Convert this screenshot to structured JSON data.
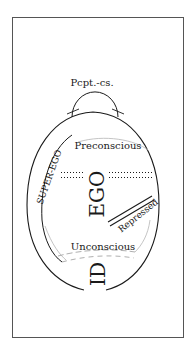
{
  "diagram": {
    "type": "structural model of the psyche",
    "labels": {
      "perception": "Pcpt.-cs.",
      "preconscious": "Preconscious",
      "ego": "EGO",
      "superego": "SUPER-EGO",
      "repressed": "Repressed",
      "unconscious": "Unconscious",
      "id": "ID"
    },
    "colors": {
      "ink": "#1a1a1a",
      "frame": "#555555",
      "faint": "#b5b5b5",
      "background": "#ffffff"
    }
  }
}
